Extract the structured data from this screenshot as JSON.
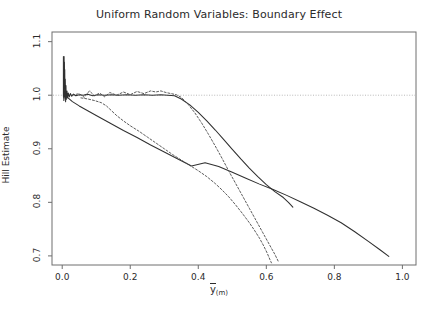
{
  "chart_data": {
    "type": "line",
    "title": "Uniform Random Variables: Boundary Effect",
    "xlabel": "ȳ(m)",
    "xlabel_symbol": "y",
    "xlabel_subscript": "(m)",
    "ylabel": "Hill Estimate",
    "xlim": [
      -0.03,
      1.04
    ],
    "ylim": [
      0.683,
      1.118
    ],
    "xticks": [
      0.0,
      0.2,
      0.4,
      0.6,
      0.8,
      1.0
    ],
    "xtick_labels": [
      "0.0",
      "0.2",
      "0.4",
      "0.6",
      "0.8",
      "1.0"
    ],
    "yticks": [
      0.7,
      0.8,
      0.9,
      1.0,
      1.1
    ],
    "ytick_labels": [
      "0.7",
      "0.8",
      "0.9",
      "1.0",
      "1.1"
    ],
    "grid": false,
    "legend": null,
    "reference_lines": [
      {
        "name": "hill-estimate-unity-reference",
        "orientation": "horizontal",
        "value": 1.0,
        "style": "dotted",
        "color": "#b9b9b9"
      }
    ],
    "series": [
      {
        "name": "upper-solid-curve",
        "style": "solid",
        "color": "#303030",
        "points": [
          [
            0.004,
            1.005
          ],
          [
            0.005,
            1.045
          ],
          [
            0.0055,
            1.072
          ],
          [
            0.006,
            1.035
          ],
          [
            0.0065,
            1.062
          ],
          [
            0.007,
            1.012
          ],
          [
            0.0075,
            1.048
          ],
          [
            0.008,
            0.998
          ],
          [
            0.009,
            1.03
          ],
          [
            0.01,
            0.988
          ],
          [
            0.011,
            1.018
          ],
          [
            0.012,
            0.992
          ],
          [
            0.014,
            1.008
          ],
          [
            0.016,
            0.995
          ],
          [
            0.018,
            1.004
          ],
          [
            0.021,
            0.997
          ],
          [
            0.024,
            1.003
          ],
          [
            0.028,
            0.998
          ],
          [
            0.033,
            1.002
          ],
          [
            0.04,
            0.999
          ],
          [
            0.05,
            1.001
          ],
          [
            0.062,
            1.0
          ],
          [
            0.075,
            1.002
          ],
          [
            0.09,
            0.999
          ],
          [
            0.105,
            1.001
          ],
          [
            0.125,
            1.0
          ],
          [
            0.145,
            1.001
          ],
          [
            0.165,
            1.0
          ],
          [
            0.19,
            1.001
          ],
          [
            0.215,
            1.0
          ],
          [
            0.24,
            1.001
          ],
          [
            0.265,
            1.0
          ],
          [
            0.29,
            1.001
          ],
          [
            0.31,
            1.0
          ],
          [
            0.33,
            0.999
          ],
          [
            0.35,
            0.993
          ],
          [
            0.375,
            0.982
          ],
          [
            0.4,
            0.968
          ],
          [
            0.425,
            0.952
          ],
          [
            0.45,
            0.935
          ],
          [
            0.475,
            0.917
          ],
          [
            0.5,
            0.899
          ],
          [
            0.525,
            0.881
          ],
          [
            0.55,
            0.864
          ],
          [
            0.575,
            0.848
          ],
          [
            0.6,
            0.833
          ],
          [
            0.625,
            0.82
          ],
          [
            0.65,
            0.809
          ],
          [
            0.665,
            0.8
          ],
          [
            0.678,
            0.791
          ]
        ]
      },
      {
        "name": "lower-solid-line",
        "style": "solid",
        "color": "#303030",
        "points": [
          [
            0.012,
            0.998
          ],
          [
            0.03,
            0.988
          ],
          [
            0.05,
            0.98
          ],
          [
            0.075,
            0.971
          ],
          [
            0.1,
            0.962
          ],
          [
            0.14,
            0.948
          ],
          [
            0.18,
            0.934
          ],
          [
            0.22,
            0.921
          ],
          [
            0.26,
            0.907
          ],
          [
            0.3,
            0.894
          ],
          [
            0.34,
            0.881
          ],
          [
            0.38,
            0.868
          ],
          [
            0.42,
            0.874
          ],
          [
            0.46,
            0.867
          ],
          [
            0.5,
            0.856
          ],
          [
            0.54,
            0.845
          ],
          [
            0.58,
            0.834
          ],
          [
            0.62,
            0.824
          ],
          [
            0.66,
            0.813
          ],
          [
            0.7,
            0.801
          ],
          [
            0.74,
            0.789
          ],
          [
            0.78,
            0.776
          ],
          [
            0.82,
            0.762
          ],
          [
            0.86,
            0.745
          ],
          [
            0.9,
            0.727
          ],
          [
            0.935,
            0.711
          ],
          [
            0.96,
            0.699
          ]
        ]
      },
      {
        "name": "upper-dashed-curve",
        "style": "dashed",
        "color": "#4a4a4a",
        "points": [
          [
            0.03,
            1.0
          ],
          [
            0.05,
            1.003
          ],
          [
            0.065,
            0.996
          ],
          [
            0.08,
            1.008
          ],
          [
            0.095,
            0.999
          ],
          [
            0.11,
            1.004
          ],
          [
            0.125,
            0.997
          ],
          [
            0.14,
            1.005
          ],
          [
            0.16,
            1.0
          ],
          [
            0.18,
            1.006
          ],
          [
            0.2,
            1.001
          ],
          [
            0.22,
            1.007
          ],
          [
            0.24,
            1.003
          ],
          [
            0.26,
            1.008
          ],
          [
            0.275,
            1.006
          ],
          [
            0.29,
            1.008
          ],
          [
            0.305,
            1.005
          ],
          [
            0.32,
            1.003
          ],
          [
            0.335,
            1.001
          ],
          [
            0.35,
            0.996
          ],
          [
            0.37,
            0.983
          ],
          [
            0.39,
            0.967
          ],
          [
            0.41,
            0.948
          ],
          [
            0.43,
            0.927
          ],
          [
            0.45,
            0.905
          ],
          [
            0.47,
            0.882
          ],
          [
            0.49,
            0.858
          ],
          [
            0.51,
            0.835
          ],
          [
            0.53,
            0.812
          ],
          [
            0.55,
            0.789
          ],
          [
            0.57,
            0.766
          ],
          [
            0.59,
            0.743
          ],
          [
            0.61,
            0.72
          ],
          [
            0.625,
            0.703
          ],
          [
            0.635,
            0.69
          ]
        ]
      },
      {
        "name": "lower-dashed-curve",
        "style": "dashed",
        "color": "#4a4a4a",
        "points": [
          [
            0.055,
            0.995
          ],
          [
            0.075,
            0.993
          ],
          [
            0.095,
            0.99
          ],
          [
            0.115,
            0.986
          ],
          [
            0.13,
            0.98
          ],
          [
            0.145,
            0.971
          ],
          [
            0.16,
            0.962
          ],
          [
            0.18,
            0.952
          ],
          [
            0.2,
            0.943
          ],
          [
            0.225,
            0.933
          ],
          [
            0.25,
            0.922
          ],
          [
            0.275,
            0.911
          ],
          [
            0.3,
            0.9
          ],
          [
            0.325,
            0.889
          ],
          [
            0.35,
            0.879
          ],
          [
            0.375,
            0.869
          ],
          [
            0.4,
            0.859
          ],
          [
            0.425,
            0.848
          ],
          [
            0.45,
            0.835
          ],
          [
            0.47,
            0.823
          ],
          [
            0.49,
            0.81
          ],
          [
            0.51,
            0.795
          ],
          [
            0.53,
            0.779
          ],
          [
            0.55,
            0.762
          ],
          [
            0.565,
            0.748
          ],
          [
            0.58,
            0.733
          ],
          [
            0.592,
            0.719
          ],
          [
            0.602,
            0.706
          ],
          [
            0.61,
            0.694
          ],
          [
            0.615,
            0.687
          ]
        ]
      },
      {
        "name": "origin-spike",
        "style": "solid",
        "color": "#303030",
        "points": [
          [
            0.0035,
            0.998
          ],
          [
            0.0035,
            1.072
          ],
          [
            0.0038,
            1.0
          ],
          [
            0.004,
            1.04
          ],
          [
            0.0042,
            0.995
          ],
          [
            0.0045,
            1.03
          ],
          [
            0.0048,
            0.99
          ],
          [
            0.0052,
            1.02
          ],
          [
            0.0056,
            0.993
          ],
          [
            0.006,
            1.012
          ],
          [
            0.0065,
            0.996
          ],
          [
            0.007,
            1.008
          ],
          [
            0.0076,
            0.997
          ],
          [
            0.0082,
            1.005
          ],
          [
            0.009,
            0.999
          ],
          [
            0.01,
            1.002
          ]
        ]
      }
    ]
  },
  "axis": {
    "y_title": "Hill Estimate"
  }
}
